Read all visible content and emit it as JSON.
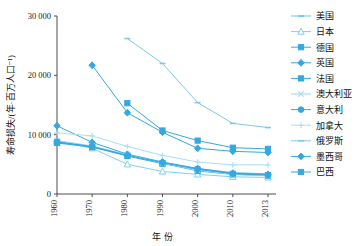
{
  "chart_data": {
    "type": "line",
    "title": "",
    "xlabel": "年 份",
    "ylabel": "寿命损失/(年·百万人口⁻¹)",
    "x": [
      1960,
      1970,
      1980,
      1990,
      2000,
      2010,
      2013
    ],
    "xtick_labels": [
      "1960",
      "1970",
      "1980",
      "1990",
      "2000",
      "2010",
      "2013"
    ],
    "ytick_labels": [
      "0",
      "10 000",
      "20 000",
      "30 000"
    ],
    "ytick_values": [
      0,
      10000,
      20000,
      30000
    ],
    "ylim": [
      0,
      30000
    ],
    "xlim": [
      1960,
      2013
    ],
    "grid": false,
    "legend_position": "right",
    "series": [
      {
        "name": "美国",
        "marker": "dash",
        "color": "#6cc3e8",
        "x": [
          1960,
          1970,
          1980,
          1990,
          2000,
          2010,
          2013
        ],
        "values": [
          8800,
          7900,
          6700,
          5300,
          4300,
          3600,
          3400
        ]
      },
      {
        "name": "日本",
        "marker": "triangle-open",
        "color": "#7fd0ee",
        "x": [
          1960,
          1970,
          1980,
          1990,
          2000,
          2010,
          2013
        ],
        "values": [
          8900,
          7700,
          5000,
          3800,
          3300,
          2900,
          2800
        ]
      },
      {
        "name": "德国",
        "marker": "square",
        "color": "#35a8e0",
        "x": [
          1960,
          1970,
          1980,
          1990,
          2000,
          2010,
          2013
        ],
        "values": [
          8700,
          8000,
          6500,
          5200,
          3900,
          3300,
          3100
        ]
      },
      {
        "name": "英国",
        "marker": "diamond",
        "color": "#35a8e0",
        "x": [
          1960,
          1970,
          1980,
          1990,
          2000,
          2010,
          2013
        ],
        "values": [
          11500,
          8700,
          6700,
          5400,
          4300,
          3500,
          3300
        ]
      },
      {
        "name": "法国",
        "marker": "square",
        "color": "#35a8e0",
        "x": [
          1960,
          1970,
          1980,
          1990,
          2000,
          2010,
          2013
        ],
        "values": [
          8600,
          7900,
          6400,
          5100,
          4100,
          3400,
          3200
        ]
      },
      {
        "name": "澳大利亚",
        "marker": "x",
        "color": "#9ad9f2",
        "x": [
          1960,
          1970,
          1980,
          1990,
          2000,
          2010,
          2013
        ],
        "values": [
          9000,
          8100,
          6600,
          5200,
          4000,
          3300,
          3100
        ]
      },
      {
        "name": "意大利",
        "marker": "circle",
        "color": "#35a8e0",
        "x": [
          1960,
          1970,
          1980,
          1990,
          2000,
          2010,
          2013
        ],
        "values": [
          8800,
          8000,
          6500,
          5300,
          4200,
          3400,
          3200
        ]
      },
      {
        "name": "加拿大",
        "marker": "plus",
        "color": "#a8dff5",
        "x": [
          1960,
          1970,
          1980,
          1990,
          2000,
          2010,
          2013
        ],
        "values": [
          10300,
          9800,
          8000,
          6500,
          5400,
          4900,
          4900
        ]
      },
      {
        "name": "俄罗斯",
        "marker": "dash",
        "color": "#7fc9e8",
        "x": [
          1980,
          1990,
          2000,
          2010,
          2013
        ],
        "values": [
          26200,
          22000,
          15400,
          11900,
          11200
        ]
      },
      {
        "name": "墨西哥",
        "marker": "diamond",
        "color": "#35a8e0",
        "x": [
          1970,
          1980,
          1990,
          2000,
          2010,
          2013
        ],
        "values": [
          21700,
          13700,
          10400,
          7700,
          7200,
          7000
        ]
      },
      {
        "name": "巴西",
        "marker": "square",
        "color": "#35a8e0",
        "x": [
          1980,
          1990,
          2000,
          2010,
          2013
        ],
        "values": [
          15300,
          10700,
          9000,
          7800,
          7600
        ]
      }
    ]
  }
}
